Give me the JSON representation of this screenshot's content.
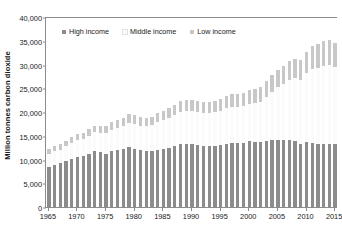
{
  "chart_data": {
    "type": "bar",
    "stacked": true,
    "title": "",
    "subtitle": "",
    "xlabel": "",
    "ylabel": "Million tonnes carbon dioxide",
    "ylim": [
      0,
      40000
    ],
    "ytick_labels": [
      "0",
      "5,000",
      "10,000",
      "15,000",
      "20,000",
      "25,000",
      "30,000",
      "35,000",
      "40,000"
    ],
    "ytick_values": [
      0,
      5000,
      10000,
      15000,
      20000,
      25000,
      30000,
      35000,
      40000
    ],
    "xtick_labels": [
      "1965",
      "1970",
      "1975",
      "1980",
      "1985",
      "1990",
      "1995",
      "2000",
      "2005",
      "2010",
      "2015"
    ],
    "xtick_values": [
      1965,
      1970,
      1975,
      1980,
      1985,
      1990,
      1995,
      2000,
      2005,
      2010,
      2015
    ],
    "grid": false,
    "legend_position": "top-left-inside",
    "colors": {
      "high_income": "#8c8c8c",
      "middle_income": "#fbfbfb",
      "low_income": "#c8c8c8",
      "axis": "#8c8c8c",
      "text": "#1a1a1a",
      "background": "#ffffff"
    },
    "categories": [
      1965,
      1966,
      1967,
      1968,
      1969,
      1970,
      1971,
      1972,
      1973,
      1974,
      1975,
      1976,
      1977,
      1978,
      1979,
      1980,
      1981,
      1982,
      1983,
      1984,
      1985,
      1986,
      1987,
      1988,
      1989,
      1990,
      1991,
      1992,
      1993,
      1994,
      1995,
      1996,
      1997,
      1998,
      1999,
      2000,
      2001,
      2002,
      2003,
      2004,
      2005,
      2006,
      2007,
      2008,
      2009,
      2010,
      2011,
      2012,
      2013,
      2014,
      2015
    ],
    "series": [
      {
        "name": "High income",
        "color": "#8c8c8c",
        "values": [
          8500,
          8900,
          9200,
          9700,
          10200,
          10600,
          10800,
          11200,
          11700,
          11500,
          11200,
          11800,
          12000,
          12200,
          12600,
          12300,
          11900,
          11700,
          11700,
          12100,
          12300,
          12500,
          12800,
          13200,
          13300,
          13300,
          13100,
          12900,
          12800,
          12900,
          13000,
          13300,
          13400,
          13400,
          13500,
          13800,
          13700,
          13700,
          13900,
          14100,
          14200,
          14100,
          14200,
          14000,
          13200,
          13600,
          13500,
          13300,
          13300,
          13300,
          13200
        ]
      },
      {
        "name": "Middle income",
        "color": "#fbfbfb",
        "values": [
          2700,
          2800,
          2900,
          3100,
          3300,
          3500,
          3600,
          3800,
          4000,
          4100,
          4300,
          4500,
          4700,
          4900,
          5100,
          5200,
          5200,
          5300,
          5500,
          5800,
          6000,
          6200,
          6500,
          6800,
          6900,
          6900,
          6900,
          6800,
          6900,
          7000,
          7200,
          7500,
          7600,
          7600,
          7700,
          7900,
          8200,
          8500,
          9300,
          10200,
          11000,
          11800,
          12600,
          13100,
          13500,
          14600,
          15500,
          16000,
          16400,
          16500,
          16300
        ]
      },
      {
        "name": "Low income",
        "color": "#c8c8c8",
        "values": [
          1000,
          1050,
          1080,
          1150,
          1200,
          1250,
          1280,
          1350,
          1430,
          1450,
          1500,
          1600,
          1650,
          1700,
          1800,
          1800,
          1800,
          1800,
          1850,
          1950,
          2000,
          2100,
          2200,
          2300,
          2350,
          2400,
          2400,
          2400,
          2450,
          2500,
          2550,
          2650,
          2750,
          2750,
          2800,
          2900,
          2950,
          3050,
          3250,
          3450,
          3600,
          3800,
          4000,
          4150,
          4200,
          4500,
          4800,
          5000,
          5200,
          5300,
          5100
        ]
      }
    ],
    "totals": [
      12200,
      12750,
      13180,
      13950,
      14700,
      15350,
      15680,
      16350,
      17130,
      17050,
      17000,
      17900,
      18350,
      18800,
      19500,
      19300,
      18900,
      18800,
      19050,
      19850,
      20300,
      20800,
      21500,
      22300,
      22550,
      22600,
      22400,
      22100,
      22150,
      22400,
      22750,
      23450,
      23750,
      23750,
      24000,
      24600,
      24850,
      25250,
      26450,
      27750,
      28800,
      29700,
      30800,
      31250,
      30900,
      32700,
      33800,
      34300,
      34900,
      35100,
      34600
    ],
    "last_bar_note": "2015 bar is partially shown at the right edge"
  },
  "legend": {
    "items": [
      {
        "label": "High income",
        "color": "#8c8c8c"
      },
      {
        "label": "Middle income",
        "color": "#fbfbfb"
      },
      {
        "label": "Low income",
        "color": "#c8c8c8"
      }
    ]
  }
}
